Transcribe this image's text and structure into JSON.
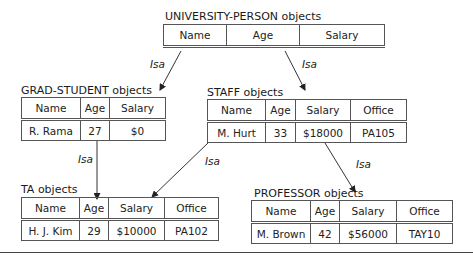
{
  "diagram": {
    "edge_label": "Isa",
    "university_person": {
      "title": "UNIVERSITY-PERSON objects",
      "columns": [
        "Name",
        "Age",
        "Salary"
      ],
      "rows": []
    },
    "grad_student": {
      "title": "GRAD-STUDENT objects",
      "columns": [
        "Name",
        "Age",
        "Salary"
      ],
      "rows": [
        [
          "R. Rama",
          "27",
          "$0"
        ]
      ]
    },
    "staff": {
      "title": "STAFF objects",
      "columns": [
        "Name",
        "Age",
        "Salary",
        "Office"
      ],
      "rows": [
        [
          "M. Hurt",
          "33",
          "$18000",
          "PA105"
        ]
      ]
    },
    "ta": {
      "title": "TA objects",
      "columns": [
        "Name",
        "Age",
        "Salary",
        "Office"
      ],
      "rows": [
        [
          "H. J. Kim",
          "29",
          "$10000",
          "PA102"
        ]
      ]
    },
    "professor": {
      "title": "PROFESSOR objects",
      "columns": [
        "Name",
        "Age",
        "Salary",
        "Office"
      ],
      "rows": [
        [
          "M. Brown",
          "42",
          "$56000",
          "TAY10"
        ]
      ]
    },
    "edges": [
      {
        "from": "UNIVERSITY-PERSON",
        "to": "GRAD-STUDENT",
        "label": "Isa"
      },
      {
        "from": "UNIVERSITY-PERSON",
        "to": "STAFF",
        "label": "Isa"
      },
      {
        "from": "GRAD-STUDENT",
        "to": "TA",
        "label": "Isa"
      },
      {
        "from": "STAFF",
        "to": "TA",
        "label": "Isa"
      },
      {
        "from": "STAFF",
        "to": "PROFESSOR",
        "label": "Isa"
      }
    ]
  }
}
